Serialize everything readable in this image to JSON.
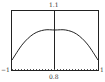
{
  "chart_data": {
    "type": "line",
    "title": "",
    "xlabel": "",
    "ylabel": "",
    "xlim": [
      -1,
      1
    ],
    "ylim": [
      0.8,
      1.1
    ],
    "grid": false,
    "legend": null,
    "tick_labels": {
      "x_left": "−1",
      "x_right": "1",
      "y_top": "1.1",
      "y_bottom": "0.8"
    },
    "series": [
      {
        "name": "curve",
        "x": [
          -1,
          -0.75,
          -0.5,
          -0.25,
          0,
          0.25,
          0.5,
          0.75,
          1
        ],
        "y": [
          0.85,
          0.93,
          0.98,
          1.0,
          1.0,
          1.0,
          0.98,
          0.93,
          0.85
        ]
      }
    ],
    "annotations": [
      "dotted baseline along bottom edge"
    ]
  }
}
